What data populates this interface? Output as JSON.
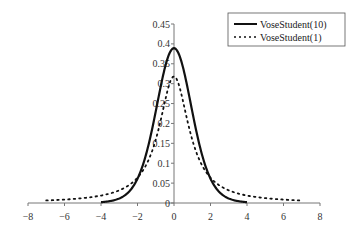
{
  "chart_data": {
    "type": "line",
    "title": "",
    "xlabel": "",
    "ylabel": "",
    "xlim": [
      -8,
      8
    ],
    "ylim": [
      0,
      0.45
    ],
    "x_ticks": [
      "-8",
      "-6",
      "-4",
      "-2",
      "0",
      "2",
      "4",
      "6",
      "8"
    ],
    "y_ticks": [
      "0",
      "0.05",
      "0.1",
      "0.15",
      "0.2",
      "0.25",
      "0.3",
      "0.35",
      "0.4",
      "0.45"
    ],
    "grid": false,
    "legend_position": "upper right",
    "series": [
      {
        "name": "VoseStudent(10)",
        "style": "solid",
        "x": [
          -4,
          -3,
          -2.5,
          -2,
          -1.5,
          -1,
          -0.5,
          0,
          0.5,
          1,
          1.5,
          2,
          2.5,
          3,
          4
        ],
        "y": [
          0.002,
          0.011,
          0.025,
          0.061,
          0.127,
          0.23,
          0.34,
          0.389,
          0.34,
          0.23,
          0.127,
          0.061,
          0.025,
          0.011,
          0.002
        ]
      },
      {
        "name": "VoseStudent(1)",
        "style": "dotted",
        "x": [
          -7,
          -6,
          -5,
          -4,
          -3,
          -2,
          -1.5,
          -1,
          -0.5,
          0,
          0.5,
          1,
          1.5,
          2,
          3,
          4,
          5,
          6,
          7
        ],
        "y": [
          0.006,
          0.009,
          0.012,
          0.019,
          0.032,
          0.064,
          0.098,
          0.159,
          0.255,
          0.318,
          0.255,
          0.159,
          0.098,
          0.064,
          0.032,
          0.019,
          0.012,
          0.009,
          0.006
        ]
      }
    ]
  },
  "legend": {
    "items": [
      "VoseStudent(10)",
      "VoseStudent(1)"
    ]
  }
}
